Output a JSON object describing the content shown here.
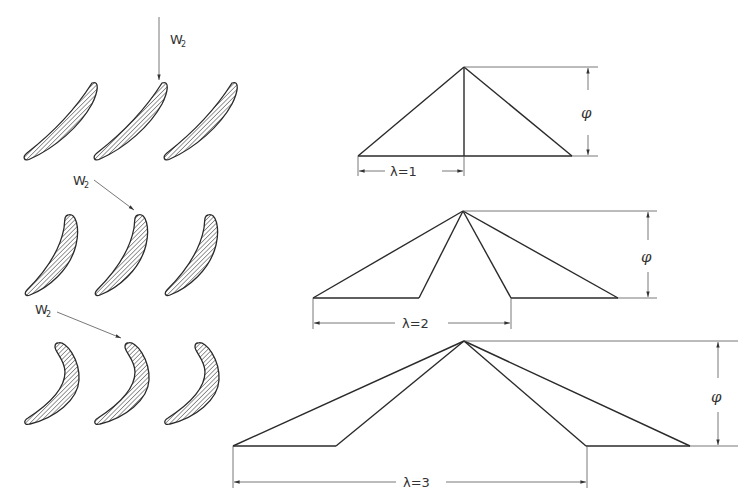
{
  "figure": {
    "cascades": [
      {
        "id": "cascade-1",
        "inlet_label": "W",
        "inlet_subscript": "2",
        "direction": "axial"
      },
      {
        "id": "cascade-2",
        "inlet_label": "W",
        "inlet_subscript": "2",
        "direction": "oblique"
      },
      {
        "id": "cascade-3",
        "inlet_label": "W",
        "inlet_subscript": "2",
        "direction": "oblique"
      }
    ],
    "velocity_triangles": [
      {
        "id": "triangle-1",
        "lambda_label": "λ=1",
        "phi_label": "φ"
      },
      {
        "id": "triangle-2",
        "lambda_label": "λ=2",
        "phi_label": "φ"
      },
      {
        "id": "triangle-3",
        "lambda_label": "λ=3",
        "phi_label": "φ"
      }
    ]
  },
  "colors": {
    "line": "#2a2a2a",
    "background": "#ffffff"
  }
}
